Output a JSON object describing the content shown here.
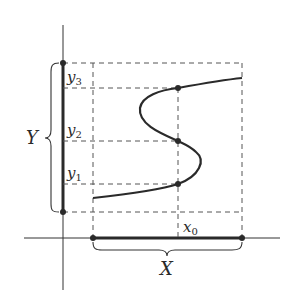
{
  "diagram": {
    "labels": {
      "y3": "y",
      "y3_sub": "3",
      "y2": "y",
      "y2_sub": "2",
      "y1": "y",
      "y1_sub": "1",
      "x0": "x",
      "x0_sub": "0",
      "Y": "Y",
      "X": "X"
    },
    "ink_color": "#2a2a2a",
    "background": "#ffffff"
  }
}
